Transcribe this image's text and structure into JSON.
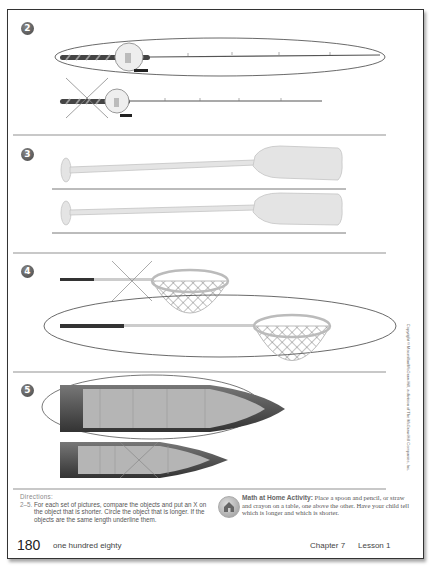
{
  "problems": [
    {
      "number": "2",
      "objects": "fishing-rods",
      "longer": "top",
      "shorter": "bottom",
      "marking": "top circled, bottom crossed out"
    },
    {
      "number": "3",
      "objects": "oars",
      "longer": "same",
      "marking": "both underlined"
    },
    {
      "number": "4",
      "objects": "fishing-nets",
      "longer": "bottom",
      "shorter": "top",
      "marking": "bottom circled, top crossed out"
    },
    {
      "number": "5",
      "objects": "canoes",
      "longer": "top",
      "shorter": "bottom",
      "marking": "top circled, bottom crossed out"
    }
  ],
  "directions": {
    "title": "Directions:",
    "range": "2–5.",
    "text": "For each set of pictures, compare the objects and put an X on the object that is shorter. Circle the object that is longer. If the objects are the same length underline them."
  },
  "home_activity": {
    "title": "Math at Home Activity:",
    "text": "Place a spoon and pencil, or straw and crayon on a table, one above the other. Have your child tell which is longer and which is shorter.",
    "icon": "house-icon"
  },
  "footer": {
    "page_number": "180",
    "page_words": "one hundred eighty",
    "chapter": "Chapter 7",
    "lesson": "Lesson 1"
  },
  "copyright": "Copyright © Macmillan/McGraw-Hill, a division of The McGraw-Hill Companies, Inc.",
  "colors": {
    "border": "#333333",
    "divider": "#c8c8c8",
    "badge": "#555555",
    "text": "#555555"
  }
}
